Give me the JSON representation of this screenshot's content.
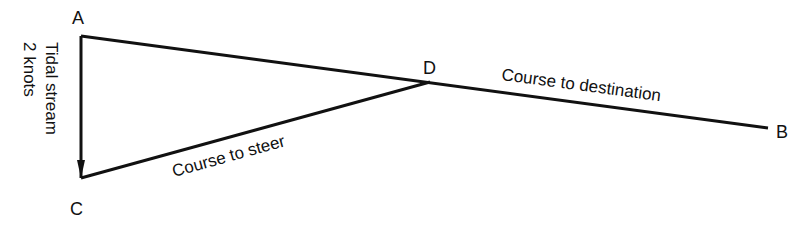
{
  "diagram": {
    "points": {
      "A": {
        "label": "A"
      },
      "B": {
        "label": "B"
      },
      "C": {
        "label": "C"
      },
      "D": {
        "label": "D"
      }
    },
    "labels": {
      "tidal_line1": "Tidal stream",
      "tidal_line2": "2 knots",
      "course_to_destination": "Course to destination",
      "course_to_steer": "Course to steer"
    },
    "colors": {
      "line": "#111111",
      "background": "#ffffff"
    }
  }
}
